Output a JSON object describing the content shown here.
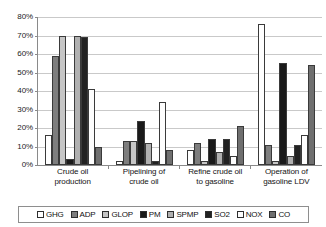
{
  "chart_data": {
    "type": "bar",
    "title": "",
    "xlabel": "",
    "ylabel": "",
    "ylim": [
      0,
      80
    ],
    "ytick_labels": [
      "80%",
      "70%",
      "60%",
      "50%",
      "40%",
      "30%",
      "20%",
      "10%",
      "0%"
    ],
    "ytick_values": [
      80,
      70,
      60,
      50,
      40,
      30,
      20,
      10,
      0
    ],
    "grid": true,
    "legend_position": "bottom",
    "categories": [
      "Crude oil production",
      "Pipelining of crude oil",
      "Refine crude oil to gasoline",
      "Operation of gasoline LDV"
    ],
    "category_lines": [
      [
        "Crude oil",
        "production"
      ],
      [
        "Pipelining of",
        "crude oil"
      ],
      [
        "Refine crude oil",
        "to gasoline"
      ],
      [
        "Operation of",
        "gasoline LDV"
      ]
    ],
    "series": [
      {
        "name": "GHG",
        "key": "ghg",
        "color": "#ffffff",
        "values": [
          16,
          2,
          8,
          76
        ]
      },
      {
        "name": "ADP",
        "key": "adp",
        "color": "#7e7e7e",
        "values": [
          59,
          13,
          12,
          11
        ]
      },
      {
        "name": "GLOP",
        "key": "glop",
        "color": "#c6c6c6",
        "values": [
          70,
          13,
          2,
          2
        ]
      },
      {
        "name": "PM",
        "key": "pm",
        "color": "#1a1a1a",
        "values": [
          3,
          24,
          14,
          55
        ]
      },
      {
        "name": "SPMP",
        "key": "spmp",
        "color": "#b0b0b0",
        "values": [
          70,
          12,
          7,
          5
        ]
      },
      {
        "name": "SO2",
        "key": "so2",
        "color": "#222222",
        "values": [
          69,
          2,
          14,
          11
        ]
      },
      {
        "name": "NOX",
        "key": "nox",
        "color": "#fdfdfd",
        "values": [
          41,
          34,
          5,
          16
        ]
      },
      {
        "name": "CO",
        "key": "co",
        "color": "#6f6f6f",
        "values": [
          10,
          8,
          21,
          54
        ]
      }
    ]
  }
}
